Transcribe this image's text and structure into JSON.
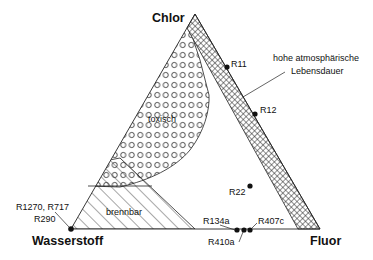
{
  "diagram": {
    "type": "ternary",
    "corners": {
      "top": "Chlor",
      "left": "Wasserstoff",
      "right": "Fluor"
    },
    "regions": [
      {
        "id": "toxic",
        "label": "toxisch",
        "pattern": "circles"
      },
      {
        "id": "flammable",
        "label": "brennbar",
        "pattern": "diagonal-hatch"
      },
      {
        "id": "lifetime",
        "label_line1": "hohe atmosphärische",
        "label_line2": "Lebensdauer",
        "pattern": "cross-hatch"
      }
    ],
    "points": [
      {
        "label": "R11"
      },
      {
        "label": "R12"
      },
      {
        "label": "R22"
      },
      {
        "label": "R1270, R717"
      },
      {
        "label": "R290"
      },
      {
        "label": "R134a"
      },
      {
        "label": "R410a"
      },
      {
        "label": "R407c"
      }
    ]
  }
}
